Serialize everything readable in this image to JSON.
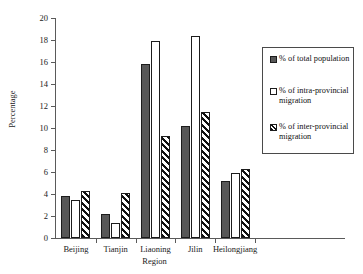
{
  "chart_data": {
    "type": "bar",
    "title": "",
    "xlabel": "Region",
    "ylabel": "Percentage",
    "ylim": [
      0,
      20
    ],
    "ytick_step": 2,
    "yticks": [
      "20",
      "18",
      "16",
      "14",
      "12",
      "10",
      "8",
      "6",
      "4",
      "2",
      "0"
    ],
    "grid": false,
    "legend_position": "right",
    "categories": [
      "Beijing",
      "Tianjin",
      "Liaoning",
      "Jilin",
      "Heilongjiang"
    ],
    "series": [
      {
        "name": "% of total population",
        "key": "total",
        "style": "solid-dark",
        "color": "#585858",
        "values": [
          3.8,
          2.2,
          15.8,
          10.2,
          5.2
        ]
      },
      {
        "name": "% of intra-provincial migration",
        "key": "intra",
        "style": "white",
        "color": "#ffffff",
        "values": [
          3.5,
          1.4,
          17.9,
          18.4,
          5.9
        ]
      },
      {
        "name": "% of inter-provincial migration",
        "key": "inter",
        "style": "hatched",
        "color": "#111111",
        "values": [
          4.3,
          4.1,
          9.3,
          11.5,
          6.3
        ]
      }
    ]
  },
  "legend": {
    "items": [
      {
        "label": "% of total population",
        "swatch": "total"
      },
      {
        "label": "% of intra-provincial migration",
        "swatch": "intra"
      },
      {
        "label": "% of inter-provincial migration",
        "swatch": "inter"
      }
    ]
  }
}
